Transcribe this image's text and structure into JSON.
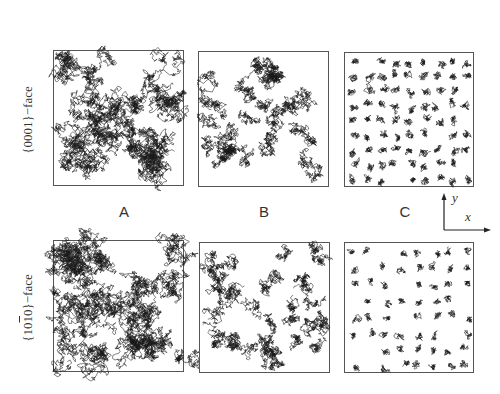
{
  "figure": {
    "row_labels": [
      {
        "prefix": "{000",
        "digit": "1",
        "suffix": "}−face",
        "text": "{0001}−face"
      },
      {
        "text_a": "{10",
        "overline_digit": "1",
        "text_b": "0}−face",
        "text": "{10̅0}−face"
      }
    ],
    "column_labels": [
      "A",
      "B",
      "C"
    ],
    "axes": {
      "x_label": "x",
      "y_label": "y"
    },
    "panels": [
      {
        "row": "{0001}-face",
        "column": "A",
        "density": "dense, interconnected clusters"
      },
      {
        "row": "{0001}-face",
        "column": "B",
        "density": "medium, partially connected clusters"
      },
      {
        "row": "{0001}-face",
        "column": "C",
        "density": "sparse, isolated small clusters"
      },
      {
        "row": "{10-10}-face",
        "column": "A",
        "density": "dense, interconnected clusters"
      },
      {
        "row": "{10-10}-face",
        "column": "B",
        "density": "medium, partially connected clusters"
      },
      {
        "row": "{10-10}-face",
        "column": "C",
        "density": "sparse, isolated small clusters"
      }
    ],
    "colors": {
      "trace": "#1a1a1a",
      "frame": "#555555",
      "background": "#ffffff"
    }
  }
}
